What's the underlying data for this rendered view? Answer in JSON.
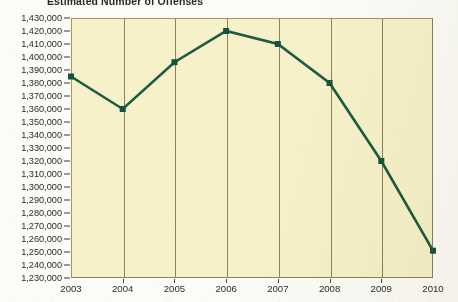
{
  "title": "Estimated Number of Offenses",
  "colors": {
    "plot_background": "#f6f1c9",
    "plot_border": "#8a8258",
    "gridline": "#6f6a42",
    "series_line": "#1b5c43",
    "series_marker": "#17533c",
    "axis_text": "#2b2b2b",
    "page_background": "#fcfbf7"
  },
  "y_axis": {
    "label": "",
    "min": 1230000,
    "max": 1430000,
    "step": 10000,
    "tick_labels": [
      "1,430,000",
      "1,420,000",
      "1,410,000",
      "1,400,000",
      "1,390,000",
      "1,380,000",
      "1,370,000",
      "1,360,000",
      "1,350,000",
      "1,340,000",
      "1,330,000",
      "1,320,000",
      "1,310,000",
      "1,300,000",
      "1,290,000",
      "1,280,000",
      "1,270,000",
      "1,260,000",
      "1,250,000",
      "1,240,000",
      "1,230,000"
    ],
    "tick_values": [
      1430000,
      1420000,
      1410000,
      1400000,
      1390000,
      1380000,
      1370000,
      1360000,
      1350000,
      1340000,
      1330000,
      1320000,
      1310000,
      1300000,
      1290000,
      1280000,
      1270000,
      1260000,
      1250000,
      1240000,
      1230000
    ]
  },
  "x_axis": {
    "label": "",
    "tick_labels": [
      "2003",
      "2004",
      "2005",
      "2006",
      "2007",
      "2008",
      "2009",
      "2010"
    ]
  },
  "chart_data": {
    "type": "line",
    "title": "Estimated Number of Offenses",
    "xlabel": "",
    "ylabel": "",
    "categories": [
      "2003",
      "2004",
      "2005",
      "2006",
      "2007",
      "2008",
      "2009",
      "2010"
    ],
    "values": [
      1385000,
      1360000,
      1396000,
      1420000,
      1410000,
      1380000,
      1320000,
      1251000
    ],
    "series": [
      {
        "name": "Estimated Number of Offenses",
        "values": [
          1385000,
          1360000,
          1396000,
          1420000,
          1410000,
          1380000,
          1320000,
          1251000
        ]
      }
    ],
    "ylim": [
      1230000,
      1430000
    ],
    "ytick_step": 10000,
    "grid": "vertical-only",
    "legend": "none",
    "marker": "square",
    "line_color": "#1b5c43"
  }
}
